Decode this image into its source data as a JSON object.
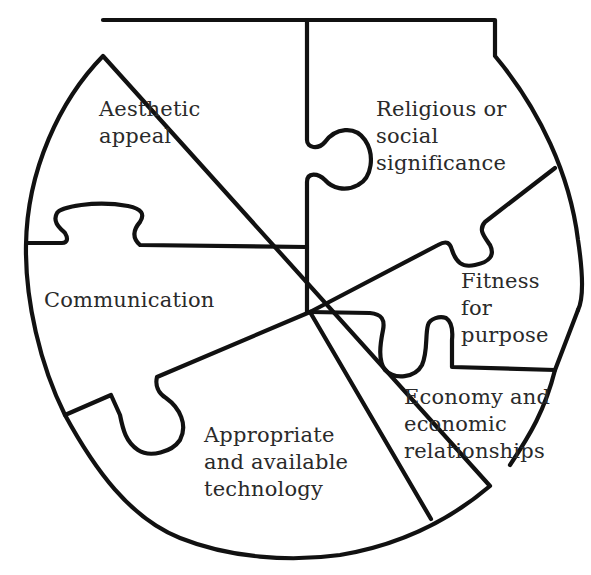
{
  "diagram": {
    "type": "jigsaw-puzzle-bowl",
    "stroke_color": "#111111",
    "text_color": "#2a2a2a",
    "background": "#ffffff",
    "pieces": [
      {
        "id": "aesthetic",
        "label_lines": [
          "Aesthetic",
          "appeal"
        ]
      },
      {
        "id": "religious",
        "label_lines": [
          "Religious or",
          "social",
          "significance"
        ]
      },
      {
        "id": "communication",
        "label_lines": [
          "Communication"
        ]
      },
      {
        "id": "fitness",
        "label_lines": [
          "Fitness",
          "for",
          "purpose"
        ]
      },
      {
        "id": "economy",
        "label_lines": [
          "Economy and",
          "economic",
          "relationships"
        ]
      },
      {
        "id": "technology",
        "label_lines": [
          "Appropriate",
          "and available",
          "technology"
        ]
      }
    ]
  },
  "labels": {
    "aesthetic": "Aesthetic\nappeal",
    "religious": "Religious or\nsocial\nsignificance",
    "communication": "Communication",
    "fitness": "Fitness\nfor\npurpose",
    "economy": "Economy and\neconomic\nrelationships",
    "technology": "Appropriate\nand available\ntechnology"
  }
}
